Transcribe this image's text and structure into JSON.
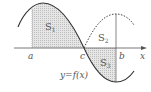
{
  "diagram": {
    "type": "function-area-graph",
    "function_label": "y=f(x)",
    "axis_label": "x",
    "points": {
      "a": "a",
      "b": "b",
      "c": "c"
    },
    "regions": {
      "s1": {
        "label": "S",
        "sub": "1",
        "shaded": true,
        "between": "a to c, above x-axis"
      },
      "s2": {
        "label": "S",
        "sub": "2",
        "shaded": false,
        "between": "c to b, under dashed reflected curve"
      },
      "s3": {
        "label": "S",
        "sub": "3",
        "shaded": true,
        "between": "c to b, below x-axis"
      }
    },
    "colors": {
      "curve": "#333333",
      "shade": "#d9d9d9",
      "axis": "#555555",
      "text": "#555555"
    }
  }
}
